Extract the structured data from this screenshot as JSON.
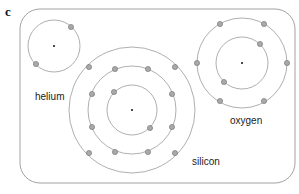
{
  "panel_label": "c",
  "colors": {
    "frame": "#8a8a8a",
    "orbit": "#8c8c8c",
    "electron_fill": "#a9a9a9",
    "electron_stroke": "#6e6e6e",
    "nucleus": "#111111"
  },
  "atoms": [
    {
      "name": "helium",
      "label": "helium",
      "center": [
        54,
        46
      ],
      "shells": [
        {
          "radius": 26,
          "electrons": [
            [
              71,
              27
            ],
            [
              36,
              64
            ]
          ]
        }
      ],
      "label_pos": [
        35,
        100
      ]
    },
    {
      "name": "silicon",
      "label": "silicon",
      "center": [
        132,
        110
      ],
      "shells": [
        {
          "radius": 25,
          "electrons": [
            [
              114,
              92
            ],
            [
              150,
              128
            ]
          ]
        },
        {
          "radius": 44,
          "electrons": [
            [
              115,
              69
            ],
            [
              148,
              69
            ],
            [
              92,
              94
            ],
            [
              172,
              94
            ],
            [
              92,
              127
            ],
            [
              172,
              127
            ],
            [
              115,
              152
            ],
            [
              148,
              152
            ]
          ]
        },
        {
          "radius": 63,
          "electrons": [
            [
              89,
              67
            ],
            [
              175,
              67
            ],
            [
              89,
              153
            ],
            [
              175,
              153
            ]
          ]
        }
      ],
      "label_pos": [
        192,
        165
      ]
    },
    {
      "name": "oxygen",
      "label": "oxygen",
      "center": [
        242,
        63
      ],
      "shells": [
        {
          "radius": 26,
          "electrons": [
            [
              260,
              44
            ],
            [
              224,
              82
            ]
          ]
        },
        {
          "radius": 45,
          "electrons": [
            [
              220,
              24
            ],
            [
              264,
              24
            ],
            [
              197,
              63
            ],
            [
              287,
              63
            ],
            [
              220,
              101
            ],
            [
              264,
              101
            ]
          ]
        }
      ],
      "label_pos": [
        230,
        124
      ]
    }
  ]
}
